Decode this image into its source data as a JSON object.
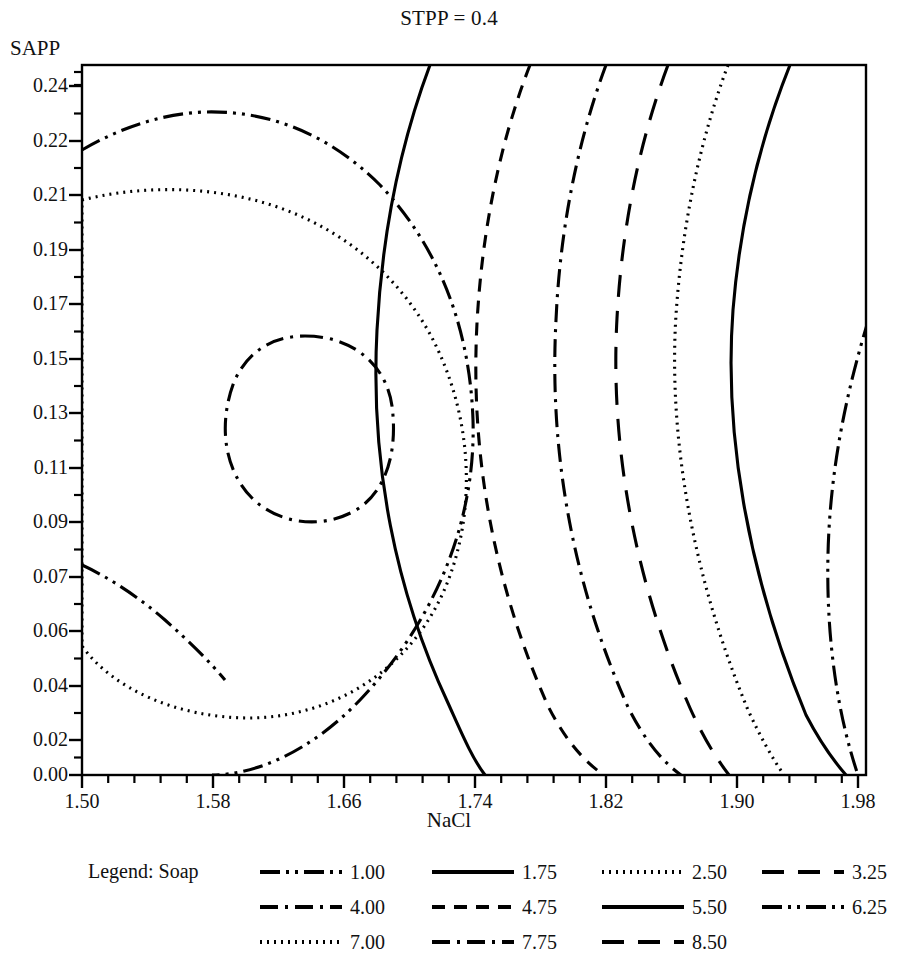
{
  "figure": {
    "title": "STPP = 0.4",
    "xlabel": "NaCl",
    "ylabel": "SAPP",
    "legend_title": "Legend: Soap",
    "line_color": "#000000",
    "frame_color": "#000000",
    "background": "#ffffff"
  },
  "chart_data": {
    "type": "line",
    "subtype": "contour",
    "title": "STPP = 0.4",
    "xlabel": "NaCl",
    "ylabel": "SAPP",
    "legend_title": "Legend: Soap",
    "legend_position": "below",
    "grid": false,
    "xlim": [
      1.5,
      2.0
    ],
    "ylim": [
      0.0,
      0.25
    ],
    "xticks": [
      "1.50",
      "1.58",
      "1.66",
      "1.74",
      "1.82",
      "1.90",
      "1.98"
    ],
    "xtick_values": [
      1.5,
      1.58,
      1.66,
      1.74,
      1.82,
      1.9,
      1.98
    ],
    "yticks": [
      "0.24",
      "0.22",
      "0.21",
      "0.19",
      "0.17",
      "0.15",
      "0.13",
      "0.11",
      "0.09",
      "0.07",
      "0.06",
      "0.04",
      "0.02",
      "0.00"
    ],
    "ytick_values": [
      0.24,
      0.22,
      0.21,
      0.19,
      0.17,
      0.15,
      0.13,
      0.11,
      0.09,
      0.07,
      0.06,
      0.04,
      0.02,
      0.0
    ],
    "levels": [
      1.0,
      1.75,
      2.5,
      3.25,
      4.0,
      4.75,
      5.5,
      6.25,
      7.0,
      7.75,
      8.5
    ],
    "level_labels": [
      "1.00",
      "1.75",
      "2.50",
      "3.25",
      "4.00",
      "4.75",
      "5.50",
      "6.25",
      "7.00",
      "7.75",
      "8.50"
    ],
    "maximum_region": {
      "x": 1.64,
      "y": 0.13,
      "level_above": 7.75
    },
    "series": [
      {
        "name": "1.00",
        "dash": "dashdotdot",
        "closed": false,
        "path": "M 869,318 C 846,393 830,470 828,554 C 826,640 838,716 858,775"
      },
      {
        "name": "1.75",
        "dash": "solid",
        "closed": false,
        "path": "M 790,65 C 760,140 740,222 733,310 C 724,430 746,570 806,715 C 818,738 832,759 846,775"
      },
      {
        "name": "2.50",
        "dash": "dotted",
        "closed": false,
        "path": "M 728,65 C 700,140 682,225 676,315 C 668,440 694,580 748,710 C 760,736 772,758 784,775"
      },
      {
        "name": "3.25",
        "dash": "longdash",
        "closed": false,
        "path": "M 668,65 C 640,140 622,225 617,318 C 610,445 634,580 690,708 C 703,737 716,758 729,775"
      },
      {
        "name": "4.00",
        "dash": "dashdot",
        "closed": false,
        "path": "M 606,65 C 578,140 560,228 556,320 C 549,450 572,583 628,707 C 643,737 660,760 681,775"
      },
      {
        "name": "4.75",
        "dash": "dashed",
        "closed": false,
        "path": "M 530,65 C 500,142 482,230 477,323 C 470,455 494,585 548,706 C 564,738 584,762 604,775"
      },
      {
        "name": "5.50",
        "dash": "solid",
        "closed": false,
        "path": "M 430,65 C 400,145 382,235 377,330 C 370,465 396,592 448,703 C 462,734 472,758 485,775"
      },
      {
        "name": "6.25",
        "dash": "dashdotdot",
        "closed": false,
        "path": "M 82,150 C 120,128 160,114 204,112 C 270,110 330,135 380,185 C 440,248 470,330 473,420 C 476,520 436,620 360,700 C 310,752 255,775 212,775 M 82,565 C 110,578 140,598 165,620 C 190,642 210,662 225,680"
      },
      {
        "name": "7.00",
        "dash": "dotted",
        "closed": true,
        "path": "M 82,200 C 130,188 185,186 236,196 C 320,212 390,262 430,334 C 472,412 478,508 446,586 C 412,668 336,717 250,718 C 176,718 112,688 82,646 Z"
      },
      {
        "name": "7.75",
        "dash": "dashdot",
        "closed": true,
        "path": "M 305,336 C 352,336 386,364 392,406 C 398,452 386,492 356,510 C 322,530 278,524 252,498 C 224,470 218,424 234,382 C 248,350 274,336 305,336 Z"
      },
      {
        "name": "8.50",
        "dash": "longdash",
        "closed": false,
        "path": ""
      }
    ],
    "boundary_crossings": {
      "top_edge_x_values": [
        1.72,
        1.78,
        1.83,
        1.87,
        1.91,
        1.95,
        1.98
      ],
      "bottom_edge_x_values": [
        1.76,
        1.83,
        1.88,
        1.91,
        1.95,
        1.98
      ],
      "left_edge_y_values": [
        0.225,
        0.074,
        0.055,
        0.033,
        0.012
      ]
    }
  },
  "ytick_positions": [
    {
      "label": "0.24",
      "y": 86
    },
    {
      "label": "0.22",
      "y": 141
    },
    {
      "label": "0.21",
      "y": 195
    },
    {
      "label": "0.19",
      "y": 250
    },
    {
      "label": "0.17",
      "y": 304
    },
    {
      "label": "0.15",
      "y": 359
    },
    {
      "label": "0.13",
      "y": 413
    },
    {
      "label": "0.11",
      "y": 468
    },
    {
      "label": "0.09",
      "y": 522
    },
    {
      "label": "0.07",
      "y": 577
    },
    {
      "label": "0.06",
      "y": 631
    },
    {
      "label": "0.04",
      "y": 686
    },
    {
      "label": "0.02",
      "y": 740
    },
    {
      "label": "0.00",
      "y": 775
    }
  ],
  "xtick_positions": [
    {
      "label": "1.50",
      "x": 82
    },
    {
      "label": "1.58",
      "x": 213
    },
    {
      "label": "1.66",
      "x": 344
    },
    {
      "label": "1.74",
      "x": 475
    },
    {
      "label": "1.82",
      "x": 606
    },
    {
      "label": "1.90",
      "x": 737
    },
    {
      "label": "1.98",
      "x": 858
    }
  ],
  "legend": {
    "title": "Legend: Soap",
    "rows": [
      [
        {
          "label": "1.00",
          "dash": "dashdotdot"
        },
        {
          "label": "1.75",
          "dash": "solid"
        },
        {
          "label": "2.50",
          "dash": "dotted"
        },
        {
          "label": "3.25",
          "dash": "longdash"
        }
      ],
      [
        {
          "label": "4.00",
          "dash": "dashdot"
        },
        {
          "label": "4.75",
          "dash": "dashed"
        },
        {
          "label": "5.50",
          "dash": "solid"
        },
        {
          "label": "6.25",
          "dash": "dashdotdot"
        }
      ],
      [
        {
          "label": "7.00",
          "dash": "dotted"
        },
        {
          "label": "7.75",
          "dash": "dashdot"
        },
        {
          "label": "8.50",
          "dash": "longdash"
        }
      ]
    ],
    "column_x": [
      258,
      430,
      600,
      760
    ],
    "row_y": [
      5,
      40,
      75
    ]
  }
}
